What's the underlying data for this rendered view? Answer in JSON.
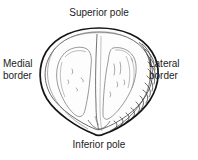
{
  "figure": {
    "title_alt": "Anatomical line drawing of an ovoid organ in coronal section",
    "background_color": "#ffffff",
    "ink_color": "#1a1a1a",
    "faint_ink_color": "#8a8a8a",
    "hatch_color": "#2b2b2b"
  },
  "labels": {
    "superior_pole": "Superior pole",
    "inferior_pole": "Inferior pole",
    "medial_border_line1": "Medial",
    "medial_border_line2": "border",
    "lateral_border_line1": "Lateral",
    "lateral_border_line2": "border"
  }
}
